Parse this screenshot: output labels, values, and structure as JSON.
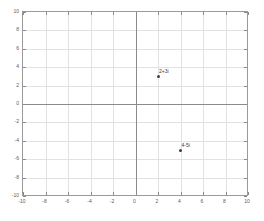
{
  "chart_data": {
    "type": "scatter",
    "title": "",
    "xlabel": "",
    "ylabel": "",
    "xlim": [
      -10,
      10
    ],
    "ylim": [
      -10,
      10
    ],
    "grid": true,
    "legend": null,
    "xticks": [
      "-10",
      "-8",
      "-6",
      "-4",
      "-2",
      "0",
      "2",
      "4",
      "6",
      "8",
      "10"
    ],
    "xtick_values": [
      -10,
      -8,
      -6,
      -4,
      -2,
      0,
      2,
      4,
      6,
      8,
      10
    ],
    "yticks": [
      "10",
      "8",
      "6",
      "4",
      "2",
      "0",
      "-2",
      "-4",
      "-6",
      "-8",
      "-10"
    ],
    "ytick_values": [
      10,
      8,
      6,
      4,
      2,
      0,
      -2,
      -4,
      -6,
      -8,
      -10
    ],
    "points": [
      {
        "x": 2,
        "y": 3,
        "label": "2+3i"
      },
      {
        "x": 4,
        "y": -5,
        "label": "4-5i"
      }
    ],
    "marker_color": "#3c3c46",
    "grid_color": "#e2e2e2",
    "axis_color": "#8a8a8a",
    "background_color": "#ffffff"
  }
}
